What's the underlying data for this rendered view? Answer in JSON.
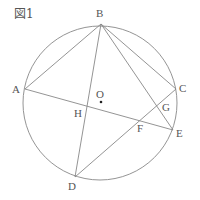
{
  "figure": {
    "title": "図1",
    "circle": {
      "center": "O",
      "cx": 100,
      "cy": 103,
      "r": 77
    },
    "points": {
      "A": {
        "x": 25,
        "y": 89
      },
      "B": {
        "x": 101,
        "y": 24
      },
      "C": {
        "x": 176,
        "y": 89
      },
      "D": {
        "x": 75,
        "y": 177
      },
      "E": {
        "x": 173,
        "y": 130
      },
      "O": {
        "x": 100,
        "y": 103
      },
      "H": {
        "x": 86,
        "y": 106
      },
      "F": {
        "x": 140,
        "y": 120
      },
      "G": {
        "x": 158,
        "y": 106
      }
    },
    "labels": {
      "A": "A",
      "B": "B",
      "C": "C",
      "D": "D",
      "E": "E",
      "O": "O",
      "H": "H",
      "F": "F",
      "G": "G"
    },
    "segments": [
      "AB",
      "BC",
      "BD",
      "BE",
      "AE",
      "DC"
    ],
    "line_color": "#888888"
  }
}
